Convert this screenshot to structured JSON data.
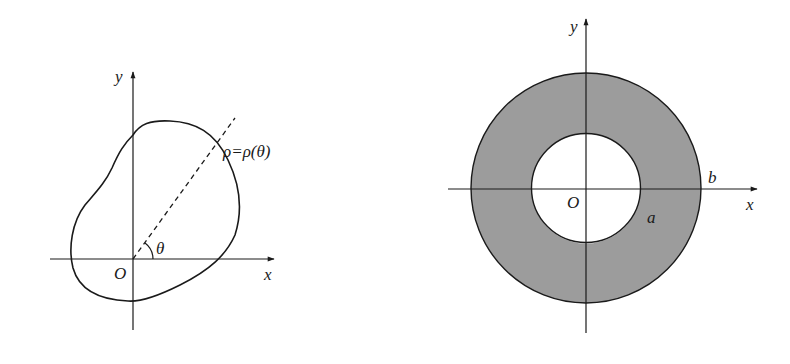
{
  "figures": [
    {
      "id": "polar-region",
      "axis_labels": {
        "x": "x",
        "y": "y",
        "origin": "O"
      },
      "curve_label": "ρ=ρ(θ)",
      "angle_label": "θ"
    },
    {
      "id": "annulus",
      "axis_labels": {
        "x": "x",
        "y": "y",
        "origin": "O"
      },
      "inner_radius_label": "a",
      "outer_radius_label": "b",
      "fill_color": "#9c9c9c"
    }
  ],
  "colors": {
    "stroke": "#1a1a1a",
    "annulus_fill": "#9c9c9c",
    "background": "#ffffff"
  }
}
